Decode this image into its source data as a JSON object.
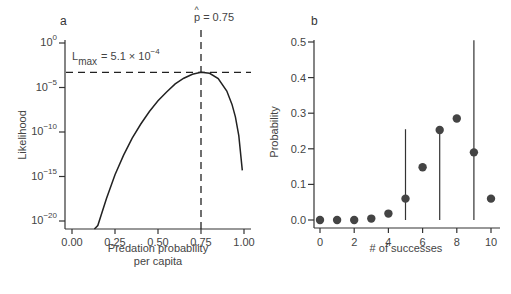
{
  "chart_data": [
    {
      "panel": "a",
      "type": "line",
      "title": "",
      "xlabel": "Predation probability per capita",
      "xlabel_lines": [
        "Predation probability",
        "per capita"
      ],
      "ylabel": "Likelihood",
      "yscale": "log",
      "xlim": [
        0.0,
        1.0
      ],
      "ylim_log10": [
        -21.8,
        0.5
      ],
      "xticks": [
        "0.00",
        "0.25",
        "0.50",
        "0.75",
        "1.00"
      ],
      "yticks": [
        {
          "base": "10",
          "exp": "0",
          "log10": 0
        },
        {
          "base": "10",
          "exp": "−5",
          "log10": -5
        },
        {
          "base": "10",
          "exp": "−10",
          "log10": -10
        },
        {
          "base": "10",
          "exp": "−15",
          "log10": -15
        },
        {
          "base": "10",
          "exp": "−20",
          "log10": -20
        }
      ],
      "annotations": {
        "p_hat": {
          "label": "p",
          "hat": "^",
          "text": "= 0.75",
          "x": 0.75
        },
        "l_max": {
          "label": "L",
          "sub": "max",
          "text": "= 5.1  × 10",
          "exp": "−4",
          "log10": -3.29
        }
      },
      "series": [
        {
          "name": "Likelihood",
          "x": [
            0.13,
            0.15,
            0.2,
            0.25,
            0.3,
            0.35,
            0.4,
            0.45,
            0.5,
            0.55,
            0.6,
            0.65,
            0.7,
            0.75,
            0.8,
            0.85,
            0.9,
            0.93,
            0.95,
            0.97,
            0.99
          ],
          "log10_y": [
            -21.8,
            -20.5,
            -17.5,
            -14.8,
            -12.6,
            -10.7,
            -9.1,
            -7.7,
            -6.5,
            -5.5,
            -4.6,
            -3.95,
            -3.5,
            -3.29,
            -3.4,
            -4.0,
            -5.4,
            -6.9,
            -8.3,
            -10.4,
            -14.3
          ]
        }
      ],
      "reference_lines": [
        {
          "orientation": "horizontal",
          "log10_y": -3.29,
          "style": "dashed"
        },
        {
          "orientation": "vertical",
          "x": 0.75,
          "style": "dashed"
        }
      ]
    },
    {
      "panel": "b",
      "type": "scatter",
      "title": "",
      "xlabel": "# of successes",
      "ylabel": "Probability",
      "xlim": [
        -0.4,
        10.4
      ],
      "ylim": [
        -0.02,
        0.52
      ],
      "xticks": [
        "0",
        "2",
        "4",
        "6",
        "8",
        "10"
      ],
      "yticks": [
        "0.0",
        "0.1",
        "0.2",
        "0.3",
        "0.4",
        "0.5"
      ],
      "categories": [
        0,
        1,
        2,
        3,
        4,
        5,
        6,
        7,
        8,
        9,
        10
      ],
      "values": [
        0.0,
        0.0,
        0.0,
        0.004,
        0.018,
        0.06,
        0.148,
        0.253,
        0.285,
        0.19,
        0.06
      ],
      "vertical_lines": [
        {
          "x": 5,
          "y0": 0.0,
          "y1": 0.255
        },
        {
          "x": 7,
          "y0": 0.0,
          "y1": 0.253
        },
        {
          "x": 9,
          "y0": 0.0,
          "y1": 0.505
        }
      ]
    }
  ],
  "labels": {
    "panel_a": "a",
    "panel_b": "b"
  }
}
